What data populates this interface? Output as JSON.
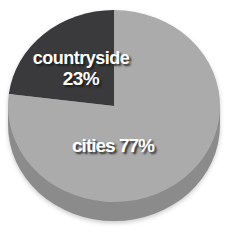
{
  "chart_data": {
    "type": "pie",
    "title": "",
    "categories": [
      "countryside",
      "cities"
    ],
    "values": [
      23,
      77
    ],
    "slices": [
      {
        "label": "countryside",
        "value": 23,
        "color": "#3a3a3c",
        "display_label": "countryside",
        "display_value": "23%"
      },
      {
        "label": "cities",
        "value": 77,
        "color": "#ababab",
        "display_label": "cities 77%"
      }
    ],
    "start_angle": "top",
    "direction": "counterclockwise",
    "effect": "3d",
    "depth_color": "#8b8b8b",
    "background_color": "#ffffff",
    "label_color": "#ffffff",
    "legend": "none"
  }
}
